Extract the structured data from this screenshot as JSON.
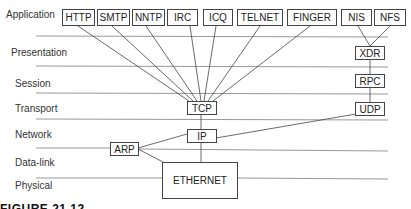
{
  "layers": [
    {
      "label": "Application",
      "x": 6,
      "y": 9
    },
    {
      "label": "Presentation",
      "x": 11,
      "y": 47
    },
    {
      "label": "Session",
      "x": 15,
      "y": 78
    },
    {
      "label": "Transport",
      "x": 15,
      "y": 103
    },
    {
      "label": "Network",
      "x": 15,
      "y": 129
    },
    {
      "label": "Data-link",
      "x": 15,
      "y": 157
    },
    {
      "label": "Physical",
      "x": 15,
      "y": 180
    }
  ],
  "protocols": {
    "http": "HTTP",
    "smtp": "SMTP",
    "nntp": "NNTP",
    "irc": "IRC",
    "icq": "ICQ",
    "telnet": "TELNET",
    "finger": "FINGER",
    "nis": "NIS",
    "nfs": "NFS",
    "xdr": "XDR",
    "rpc": "RPC",
    "tcp": "TCP",
    "udp": "UDP",
    "ip": "IP",
    "arp": "ARP",
    "ethernet": "ETHERNET"
  },
  "caption": "FIGURE 21.12"
}
